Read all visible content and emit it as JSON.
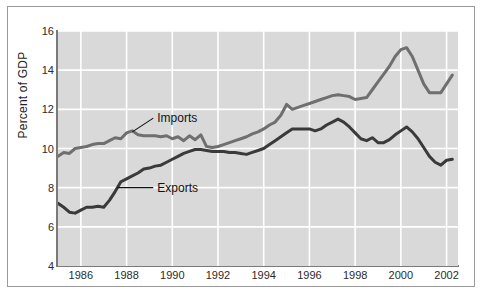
{
  "figure": {
    "background_color": "#ffffff",
    "frame_color": "#9a9a9a",
    "plot_background_color": "#d9d9d9",
    "gridline_color": "#ffffff",
    "axis_color": "#7a7a7a"
  },
  "chart_data": {
    "type": "line",
    "title": "",
    "subtitle": "",
    "xlabel": "",
    "ylabel": "Percent of GDP",
    "xlim": [
      1985.0,
      2002.5
    ],
    "ylim": [
      4,
      16
    ],
    "grid": true,
    "legend_position": "inline-annotations",
    "xticks": [
      1986,
      1988,
      1990,
      1992,
      1994,
      1996,
      1998,
      2000,
      2002
    ],
    "xtick_labels": [
      "1986",
      "1988",
      "1990",
      "1992",
      "1994",
      "1996",
      "1998",
      "2000",
      "2002"
    ],
    "yticks": [
      4,
      6,
      8,
      10,
      12,
      14,
      16
    ],
    "ytick_labels": [
      "4",
      "6",
      "8",
      "10",
      "12",
      "14",
      "16"
    ],
    "annotations": [
      {
        "text": "Imports",
        "series": "Imports",
        "x": 1989.3,
        "y": 11.55,
        "leader_to_x": 1988.25,
        "leader_to_y": 10.85
      },
      {
        "text": "Exports",
        "series": "Exports",
        "x": 1989.3,
        "y": 8.0,
        "leader_to_x": 1987.6,
        "leader_to_y": 8.0
      }
    ],
    "series": [
      {
        "name": "Imports",
        "color": "#6f6f6f",
        "line_width": 3,
        "x": [
          1985.0,
          1985.25,
          1985.5,
          1985.75,
          1986.0,
          1986.25,
          1986.5,
          1986.75,
          1987.0,
          1987.25,
          1987.5,
          1987.75,
          1988.0,
          1988.25,
          1988.5,
          1988.75,
          1989.0,
          1989.25,
          1989.5,
          1989.75,
          1990.0,
          1990.25,
          1990.5,
          1990.75,
          1991.0,
          1991.25,
          1991.5,
          1991.75,
          1992.0,
          1992.25,
          1992.5,
          1992.75,
          1993.0,
          1993.25,
          1993.5,
          1993.75,
          1994.0,
          1994.25,
          1994.5,
          1994.75,
          1995.0,
          1995.25,
          1995.5,
          1995.75,
          1996.0,
          1996.25,
          1996.5,
          1996.75,
          1997.0,
          1997.25,
          1997.5,
          1997.75,
          1998.0,
          1998.25,
          1998.5,
          1998.75,
          1999.0,
          1999.25,
          1999.5,
          1999.75,
          2000.0,
          2000.25,
          2000.5,
          2000.75,
          2001.0,
          2001.25,
          2001.5,
          2001.75,
          2002.0,
          2002.25
        ],
        "y": [
          9.6,
          9.8,
          9.75,
          10.0,
          10.05,
          10.1,
          10.2,
          10.25,
          10.25,
          10.4,
          10.55,
          10.5,
          10.8,
          10.9,
          10.7,
          10.65,
          10.65,
          10.65,
          10.6,
          10.65,
          10.5,
          10.6,
          10.4,
          10.65,
          10.45,
          10.7,
          10.1,
          10.05,
          10.1,
          10.2,
          10.3,
          10.4,
          10.5,
          10.6,
          10.75,
          10.85,
          11.0,
          11.2,
          11.35,
          11.7,
          12.25,
          12.0,
          12.1,
          12.2,
          12.3,
          12.4,
          12.5,
          12.6,
          12.7,
          12.75,
          12.7,
          12.65,
          12.5,
          12.55,
          12.6,
          13.0,
          13.4,
          13.8,
          14.2,
          14.7,
          15.05,
          15.15,
          14.7,
          14.0,
          13.3,
          12.85,
          12.85,
          12.85,
          13.3,
          13.75
        ]
      },
      {
        "name": "Exports",
        "color": "#3a3a3a",
        "line_width": 3,
        "x": [
          1985.0,
          1985.25,
          1985.5,
          1985.75,
          1986.0,
          1986.25,
          1986.5,
          1986.75,
          1987.0,
          1987.25,
          1987.5,
          1987.75,
          1988.0,
          1988.25,
          1988.5,
          1988.75,
          1989.0,
          1989.25,
          1989.5,
          1989.75,
          1990.0,
          1990.25,
          1990.5,
          1990.75,
          1991.0,
          1991.25,
          1991.5,
          1991.75,
          1992.0,
          1992.25,
          1992.5,
          1992.75,
          1993.0,
          1993.25,
          1993.5,
          1993.75,
          1994.0,
          1994.25,
          1994.5,
          1994.75,
          1995.0,
          1995.25,
          1995.5,
          1995.75,
          1996.0,
          1996.25,
          1996.5,
          1996.75,
          1997.0,
          1997.25,
          1997.5,
          1997.75,
          1998.0,
          1998.25,
          1998.5,
          1998.75,
          1999.0,
          1999.25,
          1999.5,
          1999.75,
          2000.0,
          2000.25,
          2000.5,
          2000.75,
          2001.0,
          2001.25,
          2001.5,
          2001.75,
          2002.0,
          2002.25
        ],
        "y": [
          7.2,
          7.0,
          6.75,
          6.7,
          6.85,
          7.0,
          7.0,
          7.05,
          7.0,
          7.35,
          7.8,
          8.3,
          8.45,
          8.6,
          8.75,
          8.95,
          9.0,
          9.1,
          9.15,
          9.3,
          9.45,
          9.6,
          9.75,
          9.85,
          9.95,
          9.95,
          9.9,
          9.85,
          9.85,
          9.85,
          9.8,
          9.8,
          9.75,
          9.7,
          9.8,
          9.9,
          10.0,
          10.2,
          10.4,
          10.6,
          10.8,
          11.0,
          11.0,
          11.0,
          11.0,
          10.9,
          11.0,
          11.2,
          11.35,
          11.5,
          11.35,
          11.1,
          10.8,
          10.5,
          10.4,
          10.55,
          10.3,
          10.3,
          10.45,
          10.7,
          10.9,
          11.1,
          10.85,
          10.5,
          10.05,
          9.6,
          9.3,
          9.15,
          9.4,
          9.45
        ]
      }
    ]
  }
}
